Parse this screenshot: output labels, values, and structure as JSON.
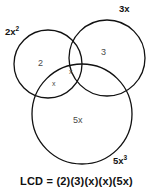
{
  "figure": {
    "background_color": "#ffffff",
    "stroke_color": "#111111",
    "circles": [
      {
        "id": "left",
        "outer_label": "2x",
        "outer_label_exponent": "2",
        "region_label": "2",
        "cx": 48,
        "cy": 64,
        "r": 34
      },
      {
        "id": "right",
        "outer_label": "3x",
        "outer_label_exponent": "",
        "region_label": "3",
        "cx": 107,
        "cy": 58,
        "r": 38
      },
      {
        "id": "bottom",
        "outer_label": "5x",
        "outer_label_exponent": "3",
        "region_label": "5x",
        "cx": 82,
        "cy": 114,
        "r": 50
      }
    ],
    "intersection_labels": [
      {
        "id": "upper",
        "label": "x"
      },
      {
        "id": "lower",
        "label": "x"
      }
    ],
    "equation": "LCD  =  (2)(3)(x)(x)(5x)"
  }
}
